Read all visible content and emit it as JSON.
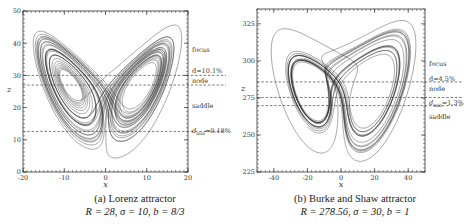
{
  "chart_data": [
    {
      "type": "line",
      "panel": "a",
      "title": "Lorenz attractor",
      "caption_label": "(a) Lorenz attractor",
      "params_text": "R = 28, σ = 10, b = 8/3",
      "params": {
        "R": 28,
        "sigma": 10,
        "b": 2.6667
      },
      "xlabel": "x",
      "ylabel": "z",
      "xlim": [
        -20,
        20
      ],
      "ylim": [
        0,
        50
      ],
      "xticks": [
        -20,
        -10,
        0,
        10,
        20
      ],
      "yticks": [
        0,
        10,
        20,
        30,
        40,
        50
      ],
      "xtick_labels": [
        "-20",
        "-10",
        "0",
        "10",
        "20"
      ],
      "ytick_labels": [
        "0",
        "10",
        "20",
        "30",
        "40",
        "50"
      ],
      "grid": false,
      "series": [
        {
          "name": "trajectory (x, z)",
          "projection": "x-z"
        }
      ],
      "reference_lines": [
        {
          "z": 30.0,
          "style": "dashed",
          "label": "d=10.1%"
        },
        {
          "z": 27.0,
          "style": "dashed",
          "label": "node"
        },
        {
          "z": 12.6,
          "style": "dashed",
          "label": "d_min=0.18%"
        }
      ],
      "annotations": [
        {
          "text": "focus",
          "z": 38
        },
        {
          "text": "d=10.1%",
          "z": 31.3
        },
        {
          "text": "node",
          "z": 28.3
        },
        {
          "text": "saddle",
          "z": 20.5
        },
        {
          "text": "d",
          "sub": "min",
          "suffix": "=0.18%",
          "z": 12.6
        }
      ]
    },
    {
      "type": "line",
      "panel": "b",
      "title": "Burke and Shaw attractor",
      "caption_label": "(b) Burke and Shaw attractor",
      "params_text": "R = 278.56, σ = 30, b = 1",
      "params": {
        "R": 278.56,
        "sigma": 30,
        "b": 1
      },
      "xlabel": "x",
      "ylabel": "z",
      "xlim": [
        -50,
        50
      ],
      "ylim": [
        225,
        335
      ],
      "xticks": [
        -40,
        -20,
        0,
        20,
        40
      ],
      "yticks": [
        225,
        250,
        275,
        300,
        325
      ],
      "xtick_labels": [
        "-40",
        "-20",
        "0",
        "20",
        "40"
      ],
      "ytick_labels": [
        "225",
        "250",
        "275",
        "300",
        "325"
      ],
      "grid": false,
      "series": [
        {
          "name": "trajectory (x, z)",
          "projection": "x-z"
        }
      ],
      "reference_lines": [
        {
          "z": 285.8,
          "style": "dashed",
          "label": "d=4.5%"
        },
        {
          "z": 275.3,
          "style": "dashed",
          "label": "node"
        },
        {
          "z": 269.8,
          "style": "dashed",
          "label": "d_min=1.3%"
        }
      ],
      "annotations": [
        {
          "text": "focus",
          "z": 298
        },
        {
          "text": "d=4.5%",
          "z": 287.5
        },
        {
          "text": "node",
          "z": 281
        },
        {
          "text": "d",
          "sub": "min",
          "suffix": "=1.3%",
          "z": 271.5
        },
        {
          "text": "saddle",
          "z": 262
        }
      ]
    }
  ]
}
